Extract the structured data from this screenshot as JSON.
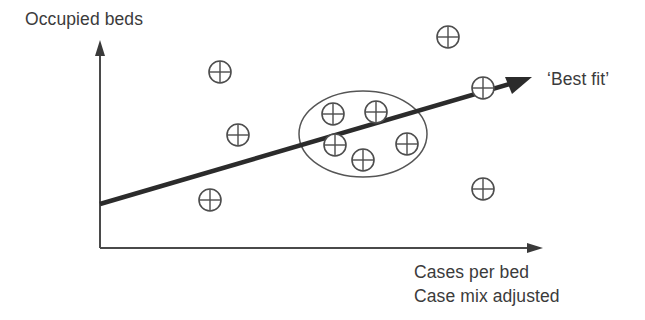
{
  "figure": {
    "title_visible": false,
    "background_color": "#ffffff",
    "ink_color": "#3a3a3a"
  },
  "axes": {
    "y_axis": {
      "label": "Occupied beds",
      "has_arrowhead": true,
      "origin_px": [
        100,
        248
      ],
      "tip_px": [
        100,
        45
      ]
    },
    "x_axis": {
      "label_line1": "Cases per bed",
      "label_line2": "Case mix adjusted",
      "has_arrowhead": true,
      "origin_px": [
        100,
        248
      ],
      "tip_px": [
        541,
        248
      ]
    }
  },
  "annotations": {
    "best_fit_label": "‘Best fit’"
  },
  "chart_data": {
    "type": "scatter",
    "title": "",
    "xlabel": "Cases per bed / Case mix adjusted",
    "ylabel": "Occupied beds",
    "grid": false,
    "legend_position": "none",
    "marker_symbol": "circle-plus",
    "marker_semantic_name": "data-point-marker",
    "axis_ranges": {
      "x_px": [
        100,
        541
      ],
      "y_px": [
        248,
        45
      ]
    },
    "points_px": [
      {
        "id": "p1",
        "x": 448,
        "y": 37,
        "in_cluster": false,
        "on_line": false
      },
      {
        "id": "p2",
        "x": 220,
        "y": 72,
        "in_cluster": false,
        "on_line": false
      },
      {
        "id": "p3",
        "x": 483,
        "y": 88,
        "in_cluster": false,
        "on_line": true
      },
      {
        "id": "p4",
        "x": 333,
        "y": 114,
        "in_cluster": true,
        "on_line": false
      },
      {
        "id": "p5",
        "x": 376,
        "y": 112,
        "in_cluster": true,
        "on_line": false
      },
      {
        "id": "p6",
        "x": 238,
        "y": 135,
        "in_cluster": false,
        "on_line": false
      },
      {
        "id": "p7",
        "x": 335,
        "y": 145,
        "in_cluster": true,
        "on_line": true
      },
      {
        "id": "p8",
        "x": 407,
        "y": 144,
        "in_cluster": true,
        "on_line": false
      },
      {
        "id": "p9",
        "x": 363,
        "y": 160,
        "in_cluster": true,
        "on_line": false
      },
      {
        "id": "p10",
        "x": 210,
        "y": 200,
        "in_cluster": false,
        "on_line": false
      },
      {
        "id": "p11",
        "x": 483,
        "y": 189,
        "in_cluster": false,
        "on_line": false
      }
    ],
    "trend_line": {
      "name": "‘Best fit’",
      "start_px": [
        100,
        204
      ],
      "end_px": [
        530,
        78
      ],
      "has_arrowhead": true,
      "color": "#2b2b2b"
    },
    "cluster_ellipse": {
      "label": "",
      "center_px": [
        363,
        134
      ],
      "radius_x_px": 64,
      "radius_y_px": 43,
      "color": "#555555",
      "enclosed_point_ids": [
        "p4",
        "p5",
        "p7",
        "p8",
        "p9"
      ]
    }
  }
}
